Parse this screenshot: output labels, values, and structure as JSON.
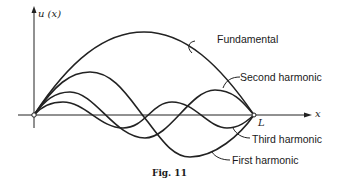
{
  "figure": {
    "caption": "Fig. 11",
    "y_axis_label": "u (x)",
    "x_axis_label": "x",
    "end_label": "L",
    "curves": [
      {
        "name": "Fundamental",
        "label": "Fundamental"
      },
      {
        "name": "Second harmonic",
        "label": "Second harmonic"
      },
      {
        "name": "Third harmonic",
        "label": "Third harmonic"
      },
      {
        "name": "First harmonic",
        "label": "First harmonic"
      }
    ]
  }
}
